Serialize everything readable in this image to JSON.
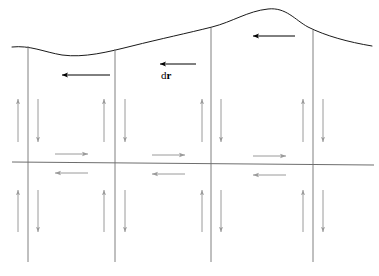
{
  "figure": {
    "title": "",
    "type": "physics-diagram",
    "canvas": {
      "width": 379,
      "height": 276,
      "background": "#ffffff"
    },
    "colors": {
      "surface_curve": "#1a1a1a",
      "field_line": "#808080",
      "axis_line": "#6e6e6e",
      "flux_arrow": "#9a9a9a",
      "displacement_arrow": "#000000",
      "label_text": "#000000"
    },
    "labels": [
      {
        "id": "dr-label",
        "text_plain": "dr",
        "text_prefix": "d",
        "text_vector": "r",
        "x": 161,
        "y": 70,
        "description": "differential displacement vector label"
      }
    ],
    "surface_curve": {
      "name": "upper-boundary-surface",
      "path": "M 12,47 C 30,45 44,52 62,55 C 84,58 108,52 132,46 C 160,39 188,33 212,27 C 232,22 248,11 268,9 C 286,7 295,20 308,27 C 326,36 348,42 372,46",
      "stroke": "#1a1a1a",
      "stroke_width": 1.0,
      "peak_x": 272,
      "peak_y": 9
    },
    "axis_line": {
      "name": "horizontal-axis",
      "x1": 12,
      "y1": 162,
      "x2": 374,
      "y2": 165,
      "stroke": "#6e6e6e",
      "stroke_width": 1.1
    },
    "vertical_lines": [
      {
        "id": "field-line-1",
        "x_top": 28,
        "y_top": 46,
        "x_bottom": 28,
        "y_bottom": 262
      },
      {
        "id": "field-line-2",
        "x_top": 115,
        "y_top": 49,
        "x_bottom": 115,
        "y_bottom": 262
      },
      {
        "id": "field-line-3",
        "x_top": 211,
        "y_top": 28,
        "x_bottom": 211,
        "y_bottom": 262
      },
      {
        "id": "field-line-4",
        "x_top": 313,
        "y_top": 30,
        "x_bottom": 313,
        "y_bottom": 262
      }
    ],
    "displacement_arrows": [
      {
        "id": "dr-arrow-left",
        "x_tail": 110,
        "x_head": 62,
        "y": 75,
        "direction": "left",
        "color": "#000000"
      },
      {
        "id": "dr-arrow-middle",
        "x_tail": 196,
        "x_head": 160,
        "y": 64,
        "direction": "left",
        "color": "#000000"
      },
      {
        "id": "dr-arrow-right",
        "x_tail": 295,
        "x_head": 253,
        "y": 36,
        "direction": "left",
        "color": "#000000"
      }
    ],
    "flux_arrows_up": [
      {
        "id": "flux-up-a",
        "x": 18,
        "y_tail": 142,
        "y_head": 99
      },
      {
        "id": "flux-up-b",
        "x": 104,
        "y_tail": 142,
        "y_head": 99
      },
      {
        "id": "flux-up-c",
        "x": 202,
        "y_tail": 142,
        "y_head": 99
      },
      {
        "id": "flux-up-d",
        "x": 303,
        "y_tail": 142,
        "y_head": 99
      },
      {
        "id": "flux-up-e",
        "x": 18,
        "y_tail": 232,
        "y_head": 190
      },
      {
        "id": "flux-up-f",
        "x": 104,
        "y_tail": 232,
        "y_head": 190
      },
      {
        "id": "flux-up-g",
        "x": 202,
        "y_tail": 232,
        "y_head": 190
      },
      {
        "id": "flux-up-h",
        "x": 303,
        "y_tail": 232,
        "y_head": 190
      }
    ],
    "flux_arrows_down": [
      {
        "id": "flux-down-a",
        "x": 38,
        "y_tail": 99,
        "y_head": 142
      },
      {
        "id": "flux-down-b",
        "x": 125,
        "y_tail": 99,
        "y_head": 142
      },
      {
        "id": "flux-down-c",
        "x": 221,
        "y_tail": 99,
        "y_head": 142
      },
      {
        "id": "flux-down-d",
        "x": 323,
        "y_tail": 99,
        "y_head": 142
      },
      {
        "id": "flux-down-e",
        "x": 38,
        "y_tail": 190,
        "y_head": 232
      },
      {
        "id": "flux-down-f",
        "x": 125,
        "y_tail": 190,
        "y_head": 232
      },
      {
        "id": "flux-down-g",
        "x": 221,
        "y_tail": 190,
        "y_head": 232
      },
      {
        "id": "flux-down-h",
        "x": 323,
        "y_tail": 190,
        "y_head": 232
      }
    ],
    "axis_arrows_right": [
      {
        "id": "axis-arrow-right-1",
        "x_tail": 55,
        "x_head": 88,
        "y": 154
      },
      {
        "id": "axis-arrow-right-2",
        "x_tail": 152,
        "x_head": 185,
        "y": 155
      },
      {
        "id": "axis-arrow-right-3",
        "x_tail": 253,
        "x_head": 286,
        "y": 156
      }
    ],
    "axis_arrows_left": [
      {
        "id": "axis-arrow-left-1",
        "x_tail": 88,
        "x_head": 55,
        "y": 173
      },
      {
        "id": "axis-arrow-left-2",
        "x_tail": 185,
        "x_head": 152,
        "y": 174
      },
      {
        "id": "axis-arrow-left-3",
        "x_tail": 286,
        "x_head": 253,
        "y": 175
      }
    ]
  }
}
